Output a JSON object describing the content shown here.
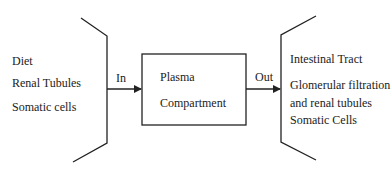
{
  "inputs": {
    "items": [
      "Diet",
      "Renal Tubules",
      "Somatic cells"
    ]
  },
  "in_label": "In",
  "compartment": {
    "line1": "Plasma",
    "line2": "Compartment"
  },
  "out_label": "Out",
  "outputs": {
    "items": [
      "Intestinal Tract",
      "Glomerular filtration",
      "and renal tubules",
      "Somatic Cells"
    ]
  }
}
